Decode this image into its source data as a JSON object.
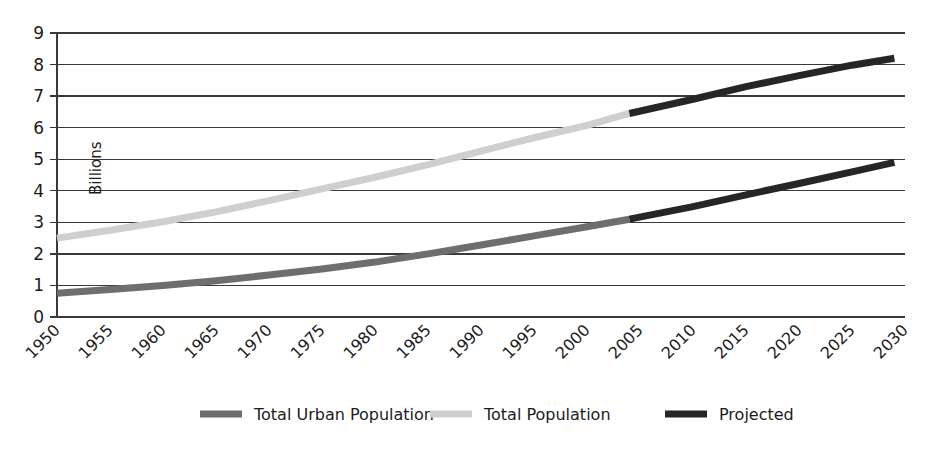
{
  "chart_data": {
    "type": "line",
    "title": "",
    "subtitle": "",
    "xlabel": "",
    "ylabel": "Billions",
    "xlim": [
      1950,
      2030
    ],
    "ylim": [
      0,
      9
    ],
    "grid": true,
    "legend_position": "bottom",
    "x_ticks": [
      "1950",
      "1955",
      "1960",
      "1965",
      "1970",
      "1975",
      "1980",
      "1985",
      "1990",
      "1995",
      "2000",
      "2005",
      "2010",
      "2015",
      "2020",
      "2025",
      "2030"
    ],
    "y_ticks": [
      "0",
      "1",
      "2",
      "3",
      "4",
      "5",
      "6",
      "7",
      "8",
      "9"
    ],
    "x_tick_rotation_deg": 45,
    "series": [
      {
        "name": "Total Urban Population",
        "color": "#6e6e6e",
        "x": [
          1950,
          1955,
          1960,
          1965,
          1970,
          1975,
          1980,
          1985,
          1990,
          1995,
          2000,
          2004
        ],
        "values": [
          0.75,
          0.87,
          1.0,
          1.15,
          1.33,
          1.52,
          1.74,
          2.0,
          2.28,
          2.57,
          2.86,
          3.1
        ]
      },
      {
        "name": "Total Population",
        "color": "#cfcfcf",
        "x": [
          1950,
          1955,
          1960,
          1965,
          1970,
          1975,
          1980,
          1985,
          1990,
          1995,
          2000,
          2004
        ],
        "values": [
          2.5,
          2.75,
          3.02,
          3.33,
          3.69,
          4.06,
          4.43,
          4.83,
          5.26,
          5.68,
          6.07,
          6.45
        ]
      },
      {
        "name": "Projected",
        "color": "#262626",
        "segments": [
          {
            "of": "Total Population",
            "x": [
              2004,
              2010,
              2015,
              2020,
              2025,
              2029
            ],
            "values": [
              6.45,
              6.9,
              7.3,
              7.65,
              7.98,
              8.2
            ]
          },
          {
            "of": "Total Urban Population",
            "x": [
              2004,
              2010,
              2015,
              2020,
              2025,
              2029
            ],
            "values": [
              3.1,
              3.5,
              3.87,
              4.23,
              4.6,
              4.9
            ]
          }
        ]
      }
    ],
    "legend": [
      {
        "label": "Total Urban Population",
        "color": "#6e6e6e"
      },
      {
        "label": "Total Population",
        "color": "#cfcfcf"
      },
      {
        "label": "Projected",
        "color": "#262626"
      }
    ]
  },
  "colors": {
    "background": "#ffffff",
    "axis": "#3a3a3a",
    "text": "#1c1c1c",
    "total_urban": "#6e6e6e",
    "total_population": "#cfcfcf",
    "projected": "#262626"
  }
}
